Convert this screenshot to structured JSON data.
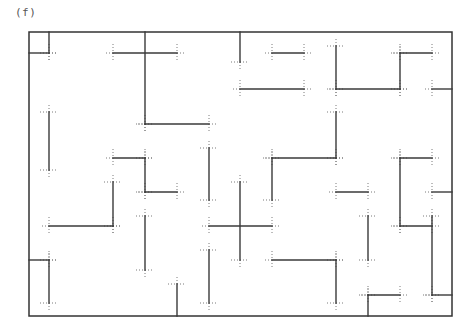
{
  "figure": {
    "label": "(f)",
    "type": "maze-grid",
    "colors": {
      "wall": "#3a3a3a",
      "border": "#333333",
      "tick": "#7a7a7a"
    },
    "border": {
      "x1": 29,
      "y1": 32,
      "x2": 452,
      "y2": 316
    },
    "walls": [
      [
        49,
        32,
        49,
        53
      ],
      [
        29,
        53,
        49,
        53
      ],
      [
        113,
        53,
        177,
        53
      ],
      [
        145,
        32,
        145,
        124
      ],
      [
        145,
        124,
        209,
        124
      ],
      [
        240,
        32,
        240,
        62
      ],
      [
        272,
        53,
        304,
        53
      ],
      [
        240,
        89,
        304,
        89
      ],
      [
        336,
        46,
        336,
        89
      ],
      [
        336,
        89,
        400,
        89
      ],
      [
        400,
        53,
        400,
        89
      ],
      [
        400,
        53,
        432,
        53
      ],
      [
        432,
        89,
        452,
        89
      ],
      [
        49,
        112,
        49,
        170
      ],
      [
        113,
        158,
        145,
        158
      ],
      [
        145,
        158,
        145,
        192
      ],
      [
        145,
        192,
        177,
        192
      ],
      [
        209,
        148,
        209,
        200
      ],
      [
        272,
        158,
        336,
        158
      ],
      [
        272,
        158,
        272,
        200
      ],
      [
        336,
        112,
        336,
        158
      ],
      [
        400,
        158,
        432,
        158
      ],
      [
        400,
        158,
        400,
        226
      ],
      [
        432,
        192,
        452,
        192
      ],
      [
        336,
        192,
        368,
        192
      ],
      [
        113,
        182,
        113,
        226
      ],
      [
        49,
        226,
        113,
        226
      ],
      [
        145,
        216,
        145,
        270
      ],
      [
        209,
        226,
        272,
        226
      ],
      [
        240,
        182,
        240,
        260
      ],
      [
        400,
        226,
        432,
        226
      ],
      [
        432,
        216,
        432,
        295
      ],
      [
        432,
        295,
        452,
        295
      ],
      [
        368,
        216,
        368,
        260
      ],
      [
        29,
        260,
        49,
        260
      ],
      [
        49,
        260,
        49,
        303
      ],
      [
        177,
        284,
        177,
        316
      ],
      [
        209,
        250,
        209,
        303
      ],
      [
        272,
        260,
        336,
        260
      ],
      [
        336,
        260,
        336,
        303
      ],
      [
        368,
        295,
        400,
        295
      ],
      [
        368,
        295,
        368,
        316
      ]
    ]
  }
}
